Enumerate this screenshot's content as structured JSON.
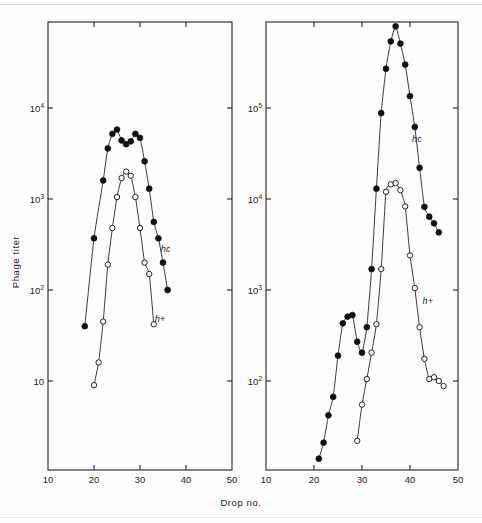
{
  "figure": {
    "xlabel": "Drop no.",
    "ylabel": "Phage titer",
    "background": "#fefefe",
    "ink_color": "#1a1a1a"
  },
  "chart_data": [
    {
      "type": "line",
      "panel": "left",
      "title": "",
      "xlabel": "Drop no.",
      "ylabel": "Phage titer",
      "xlim": [
        10,
        50
      ],
      "ylim": [
        1,
        100000
      ],
      "yscale": "log",
      "xticks": [
        10,
        20,
        30,
        40,
        50
      ],
      "xticklabels": [
        "10",
        "20",
        "30",
        "40",
        "50"
      ],
      "yticks": [
        10,
        100,
        1000,
        10000
      ],
      "yticklabels": [
        "10",
        "10²",
        "10³",
        "10⁴"
      ],
      "grid": false,
      "legend": "inline-annotation",
      "series": [
        {
          "name": "hc",
          "marker": "filled-circle",
          "label": "hc",
          "label_x": 34.5,
          "label_y": 260,
          "x": [
            18,
            20,
            22,
            23,
            24,
            25,
            26,
            27,
            28,
            29,
            30,
            31,
            32,
            33,
            34,
            35,
            36
          ],
          "y": [
            40,
            370,
            1600,
            3600,
            5200,
            5800,
            4400,
            4000,
            4300,
            5200,
            4700,
            2600,
            1300,
            560,
            370,
            200,
            100
          ]
        },
        {
          "name": "h+",
          "marker": "open-circle",
          "label": "h+",
          "label_x": 33.2,
          "label_y": 44,
          "x": [
            20,
            21,
            22,
            23,
            24,
            25,
            26,
            27,
            28,
            29,
            30,
            31,
            32,
            33
          ],
          "y": [
            9,
            16,
            45,
            190,
            480,
            1050,
            1700,
            2000,
            1800,
            1050,
            480,
            200,
            150,
            42
          ]
        }
      ]
    },
    {
      "type": "line",
      "panel": "right",
      "title": "",
      "xlabel": "Drop no.",
      "ylabel": "Phage titer",
      "xlim": [
        10,
        50
      ],
      "ylim": [
        10,
        1000000
      ],
      "yscale": "log",
      "xticks": [
        10,
        20,
        30,
        40,
        50
      ],
      "xticklabels": [
        "10",
        "20",
        "30",
        "40",
        "50"
      ],
      "yticks": [
        100,
        1000,
        10000,
        100000
      ],
      "yticklabels": [
        "10²",
        "10³",
        "10⁴",
        "10⁵"
      ],
      "grid": false,
      "legend": "inline-annotation",
      "series": [
        {
          "name": "hc",
          "marker": "filled-circle",
          "label": "hc",
          "label_x": 40.4,
          "label_y": 42000,
          "x": [
            21,
            22,
            23,
            24,
            25,
            26,
            27,
            28,
            29,
            30,
            31,
            32,
            33,
            34,
            35,
            36,
            37,
            38,
            39,
            40,
            41,
            42,
            43,
            44,
            45,
            46
          ],
          "y": [
            14,
            21,
            42,
            67,
            190,
            430,
            510,
            530,
            270,
            205,
            390,
            1700,
            13000,
            88000,
            270000,
            540000,
            790000,
            510000,
            300000,
            135000,
            62000,
            22000,
            8200,
            6400,
            5400,
            4300
          ]
        },
        {
          "name": "h+",
          "marker": "open-circle",
          "label": "h+",
          "label_x": 42.6,
          "label_y": 700,
          "x": [
            29,
            30,
            31,
            32,
            33,
            34,
            35,
            36,
            37,
            38,
            39,
            40,
            41,
            42,
            43,
            44,
            45,
            46,
            47
          ],
          "y": [
            22,
            55,
            105,
            205,
            420,
            1700,
            12000,
            14500,
            15000,
            12500,
            8300,
            2400,
            1050,
            390,
            175,
            105,
            110,
            100,
            88
          ]
        }
      ]
    }
  ]
}
